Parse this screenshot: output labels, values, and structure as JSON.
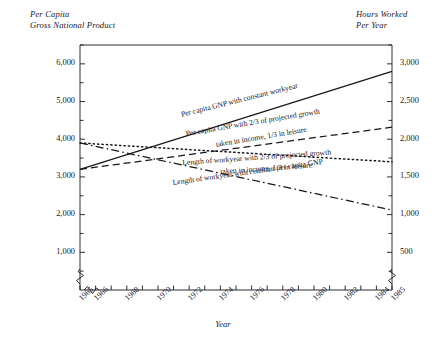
{
  "chart_data": {
    "type": "line",
    "title": "",
    "subtitle": "",
    "xlabel": "Year",
    "ylabel": "Per Capita Gross National Product",
    "y2label": "Hours Worked Per Year",
    "xlim": [
      1965,
      1985
    ],
    "ylim": [
      0,
      6500
    ],
    "y2lim": [
      0,
      3250
    ],
    "grid": false,
    "legend_position": "inline-on-lines",
    "axis_break": {
      "x_after": 1965,
      "y_near_zero": true,
      "y2_near_zero": true
    },
    "x_tick_labels": [
      "1965",
      "1966",
      "1968",
      "1970",
      "1972",
      "1974",
      "1976",
      "1978",
      "1980",
      "1982",
      "1984",
      "1985"
    ],
    "x_tick_values": [
      1965,
      1966,
      1968,
      1970,
      1972,
      1974,
      1976,
      1978,
      1980,
      1982,
      1984,
      1985
    ],
    "y_tick_labels": [
      "1,000",
      "2,000",
      "3,000",
      "4,000",
      "5,000",
      "6,000"
    ],
    "y_tick_values": [
      1000,
      2000,
      3000,
      4000,
      5000,
      6000
    ],
    "y_minor_tick_values": [
      500,
      1500,
      2500,
      3500,
      4500,
      5500,
      6500
    ],
    "y2_tick_labels": [
      "500",
      "1,000",
      "1,500",
      "2,000",
      "2,500",
      "3,000"
    ],
    "y2_tick_values": [
      500,
      1000,
      1500,
      2000,
      2500,
      3000
    ],
    "y2_minor_tick_values": [
      250,
      750,
      1250,
      1750,
      2250,
      2750,
      3250
    ],
    "series": [
      {
        "name": "Per capita GNP with constant workyear",
        "label_line1": "Per capita GNP with constant workyear",
        "label_line2": "",
        "axis": "left",
        "style": "solid",
        "color": "#17171d",
        "x": [
          1965,
          1985
        ],
        "values": [
          3200,
          5800
        ]
      },
      {
        "name": "Per capita GNP with 2/3 of projected growth taken in income, 1/3 in leisure",
        "label_line1": "Per capita GNP with 2/3 of projected growth",
        "label_line2": "taken in income, 1/3 in leisure",
        "axis": "left",
        "style": "dashed",
        "color": "#17171d",
        "x": [
          1965,
          1985
        ],
        "values": [
          3200,
          4320
        ]
      },
      {
        "name": "Length of workyear with 2/3 of projected growth taken in income, 1/3 in leisure",
        "label_line1": "Length of workyear with 2/3 of projected growth",
        "label_line2": "taken in income, 1/3 in leisure",
        "axis": "right",
        "style": "dotted",
        "color": "#17171d",
        "x": [
          1965,
          1985
        ],
        "values": [
          1950,
          1700
        ]
      },
      {
        "name": "Length of workyear with constant per capita GNP",
        "label_line1": "Length of workyear with constant per capita GNP",
        "label_line2": "",
        "axis": "right",
        "style": "dashdot",
        "color": "#17171d",
        "x": [
          1965,
          1985
        ],
        "values": [
          1950,
          1060
        ]
      }
    ]
  },
  "left_axis_title": {
    "line1": "Per Capita",
    "line2": "Gross National Product"
  },
  "right_axis_title": {
    "line1": "Hours Worked",
    "line2": "Per Year"
  },
  "x_axis_title": "Year",
  "ticks": {
    "left": [
      "6,000",
      "5,000",
      "4,000",
      "3,000",
      "2,000",
      "1,000"
    ],
    "right": [
      "3,000",
      "2,500",
      "2,000",
      "1,500",
      "1,000",
      "500"
    ],
    "bottom": [
      "1965",
      "1966",
      "1968",
      "1970",
      "1972",
      "1974",
      "1976",
      "1978",
      "1980",
      "1982",
      "1984",
      "1985"
    ]
  },
  "series_labels": {
    "s0_l1": "Per capita GNP with constant workyear",
    "s1_l1": "Per capita GNP with 2/3 of projected growth",
    "s1_l2": "taken in income, 1/3 in leisure",
    "s2_l1": "Length of workyear with 2/3 of projected growth",
    "s2_l2": "taken in income, 1/3 in leisure",
    "s3_l1": "Length of workyear with constant per capita GNP"
  },
  "colors": {
    "ink": "#17171d",
    "paper": "#ffffff"
  }
}
